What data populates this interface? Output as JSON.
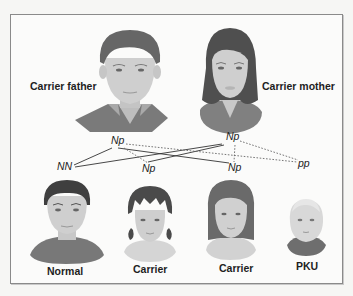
{
  "parents": {
    "father": {
      "label": "Carrier father",
      "genotype": "Np"
    },
    "mother": {
      "label": "Carrier mother",
      "genotype": "Np"
    }
  },
  "offspring": [
    {
      "genotype": "NN",
      "label": "Normal"
    },
    {
      "genotype": "Np",
      "label": "Carrier"
    },
    {
      "genotype": "Np",
      "label": "Carrier"
    },
    {
      "genotype": "pp",
      "label": "PKU"
    }
  ],
  "legend": {
    "solid_line": "N allele inherited",
    "dotted_line": "p allele inherited"
  },
  "colors": {
    "skin": "#cfcfcf",
    "hair_dark": "#5a5a5a",
    "clothing": "#7d7d7d",
    "frame": "#8a8a8a",
    "text": "#1e1e1e"
  }
}
